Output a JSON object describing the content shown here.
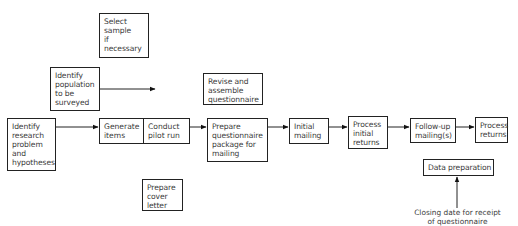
{
  "diagram": {
    "title": "",
    "boxes": {
      "select_sample": "Select\nsample\nif\nnecessary",
      "identify_population": "Identify\npopulation\nto be\nsurveyed",
      "identify_research": "Identify\nresearch\nproblem\nand\nhypotheses",
      "generate_items": "Generate\nitems",
      "conduct_pilot": "Conduct\npilot run",
      "prepare_cover_letter": "Prepare\ncover\nletter",
      "revise_assemble": "Revise and\nassemble\nquestionnaire",
      "prepare_package": "Prepare\nquestionnaire\npackage for\nmailing",
      "initial_mailing": "Initial\nmailing",
      "process_initial_returns": "Process\ninitial\nreturns",
      "follow_up_mailing": "Follow-up\nmailing(s)",
      "process_returns": "Process\nreturns",
      "data_preparation": "Data preparation"
    },
    "captions": {
      "closing_date": "Closing date for receipt\nof questionnaire"
    },
    "flow": [
      "Identify research problem and hypotheses",
      "Generate items",
      "Conduct pilot run",
      "Prepare questionnaire package for mailing",
      "Initial mailing",
      "Process initial returns",
      "Follow-up mailing(s)",
      "Process returns"
    ]
  }
}
